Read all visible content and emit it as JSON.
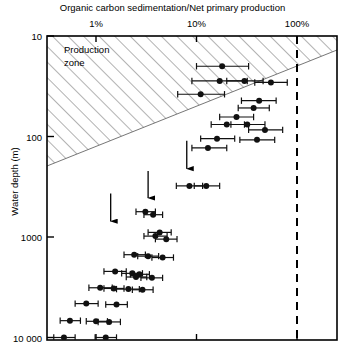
{
  "chart_data": {
    "type": "scatter",
    "title": "Organic carbon sedimentation/Net primary production",
    "xlabel": "Organic carbon sedimentation/Net primary production",
    "ylabel": "Water depth (m)",
    "x_scale": "log",
    "y_scale": "log",
    "y_inverted": true,
    "xlim": [
      0.3,
      400
    ],
    "ylim": [
      10,
      20000
    ],
    "grid": false,
    "legend": null,
    "x_unit": "%",
    "xticks": [
      1,
      10,
      100
    ],
    "xtick_labels": [
      "1%",
      "10%",
      "100%"
    ],
    "yticks": [
      10,
      100,
      1000,
      10000
    ],
    "ytick_labels": [
      "10",
      "100",
      "1000",
      "10 000"
    ],
    "annotations": [
      {
        "name": "production-zone",
        "label": "Production zone",
        "style": "hatched-triangle"
      },
      {
        "name": "hundred-percent-line",
        "label": "100%",
        "style": "dashed-vertical",
        "x": 100
      }
    ],
    "arrows": [
      {
        "x": 1.4,
        "y_from": 370,
        "y_to": 800,
        "direction": "down"
      },
      {
        "x": 3.3,
        "y_from": 220,
        "y_to": 470,
        "direction": "down"
      },
      {
        "x": 8.0,
        "y_from": 110,
        "y_to": 240,
        "direction": "down"
      }
    ],
    "points": [
      {
        "x": 18.0,
        "y": 20,
        "xerr_low": 10.0,
        "xerr_high": 33.0
      },
      {
        "x": 17.0,
        "y": 28,
        "xerr_low": 9.0,
        "xerr_high": 32.0
      },
      {
        "x": 30.0,
        "y": 28,
        "xerr_low": 20.0,
        "xerr_high": 46.0
      },
      {
        "x": 55.0,
        "y": 29,
        "xerr_low": 38.0,
        "xerr_high": 80.0
      },
      {
        "x": 11.0,
        "y": 38,
        "xerr_low": 6.5,
        "xerr_high": 19.0
      },
      {
        "x": 42.0,
        "y": 44,
        "xerr_low": 28.0,
        "xerr_high": 62.0
      },
      {
        "x": 37.0,
        "y": 52,
        "xerr_low": 26.0,
        "xerr_high": 53.0
      },
      {
        "x": 25.0,
        "y": 64,
        "xerr_low": 17.0,
        "xerr_high": 37.0
      },
      {
        "x": 20.0,
        "y": 76,
        "xerr_low": 14.0,
        "xerr_high": 30.0
      },
      {
        "x": 32.0,
        "y": 76,
        "xerr_low": 22.0,
        "xerr_high": 48.0
      },
      {
        "x": 48.0,
        "y": 86,
        "xerr_low": 33.0,
        "xerr_high": 72.0
      },
      {
        "x": 16.0,
        "y": 105,
        "xerr_low": 11.0,
        "xerr_high": 24.0
      },
      {
        "x": 40.0,
        "y": 108,
        "xerr_low": 27.0,
        "xerr_high": 60.0
      },
      {
        "x": 13.0,
        "y": 130,
        "xerr_low": 9.0,
        "xerr_high": 20.0
      },
      {
        "x": 8.5,
        "y": 310,
        "xerr_low": 6.3,
        "xerr_high": 11.5
      },
      {
        "x": 12.5,
        "y": 310,
        "xerr_low": 9.5,
        "xerr_high": 17.0
      },
      {
        "x": 3.1,
        "y": 560,
        "xerr_low": 2.5,
        "xerr_high": 3.9
      },
      {
        "x": 3.7,
        "y": 600,
        "xerr_low": 3.0,
        "xerr_high": 4.6
      },
      {
        "x": 4.3,
        "y": 900,
        "xerr_low": 3.3,
        "xerr_high": 5.6
      },
      {
        "x": 3.9,
        "y": 980,
        "xerr_low": 3.0,
        "xerr_high": 5.1
      },
      {
        "x": 5.0,
        "y": 1050,
        "xerr_low": 3.9,
        "xerr_high": 6.4
      },
      {
        "x": 2.4,
        "y": 1500,
        "xerr_low": 1.9,
        "xerr_high": 3.1
      },
      {
        "x": 3.3,
        "y": 1550,
        "xerr_low": 2.6,
        "xerr_high": 4.2
      },
      {
        "x": 4.6,
        "y": 1600,
        "xerr_low": 3.6,
        "xerr_high": 5.9
      },
      {
        "x": 1.55,
        "y": 2200,
        "xerr_low": 1.2,
        "xerr_high": 2.0
      },
      {
        "x": 2.3,
        "y": 2300,
        "xerr_low": 1.8,
        "xerr_high": 2.9
      },
      {
        "x": 2.7,
        "y": 2350,
        "xerr_low": 2.2,
        "xerr_high": 3.4
      },
      {
        "x": 2.5,
        "y": 2500,
        "xerr_low": 2.0,
        "xerr_high": 3.2
      },
      {
        "x": 3.6,
        "y": 2550,
        "xerr_low": 2.8,
        "xerr_high": 4.6
      },
      {
        "x": 1.1,
        "y": 3200,
        "xerr_low": 0.85,
        "xerr_high": 1.45
      },
      {
        "x": 1.5,
        "y": 3250,
        "xerr_low": 1.2,
        "xerr_high": 1.9
      },
      {
        "x": 2.1,
        "y": 3300,
        "xerr_low": 1.6,
        "xerr_high": 2.7
      },
      {
        "x": 2.9,
        "y": 3350,
        "xerr_low": 2.3,
        "xerr_high": 3.7
      },
      {
        "x": 0.8,
        "y": 4600,
        "xerr_low": 0.62,
        "xerr_high": 1.05
      },
      {
        "x": 1.6,
        "y": 4700,
        "xerr_low": 1.25,
        "xerr_high": 2.05
      },
      {
        "x": 0.55,
        "y": 6800,
        "xerr_low": 0.44,
        "xerr_high": 0.7
      },
      {
        "x": 1.0,
        "y": 6900,
        "xerr_low": 0.8,
        "xerr_high": 1.3
      },
      {
        "x": 1.35,
        "y": 7000,
        "xerr_low": 1.05,
        "xerr_high": 1.75
      },
      {
        "x": 0.48,
        "y": 10000,
        "xerr_low": 0.38,
        "xerr_high": 0.62
      },
      {
        "x": 1.25,
        "y": 10000,
        "xerr_low": 0.98,
        "xerr_high": 1.6
      }
    ]
  },
  "axes": {
    "x_title": "Organic carbon sedimentation/Net primary production",
    "y_title": "Water depth (m)"
  },
  "labels": {
    "production_zone_line1": "Production",
    "production_zone_line2": "zone"
  },
  "style": {
    "axis_color": "#000000",
    "point_color": "#111111",
    "hatch_color": "#555555",
    "dash_color": "#000000"
  }
}
